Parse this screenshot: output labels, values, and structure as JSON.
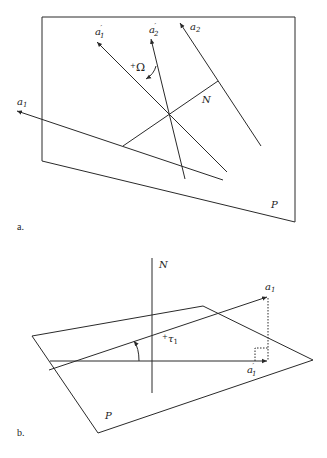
{
  "figure": {
    "panel_a": {
      "label": "a.",
      "plane_label": "P",
      "normal_label": "N",
      "axes": [
        {
          "name": "a",
          "sub": "1",
          "prime": ""
        },
        {
          "name": "a",
          "sub": "2",
          "prime": ""
        },
        {
          "name": "a",
          "sub": "1",
          "prime": "′"
        },
        {
          "name": "a",
          "sub": "2",
          "prime": "′"
        }
      ],
      "angle_label": {
        "sign": "+",
        "symbol": "Ω"
      }
    },
    "panel_b": {
      "label": "b.",
      "plane_label": "P",
      "normal_label": "N",
      "axes": [
        {
          "name": "a",
          "sub": "1",
          "prime": ""
        },
        {
          "name": "a",
          "sub": "1",
          "prime": "′"
        }
      ],
      "angle_label": {
        "sign": "+",
        "symbol": "τ",
        "sub": "1"
      }
    },
    "colors": {
      "stroke": "#2a2a2a",
      "background": "#ffffff"
    }
  }
}
